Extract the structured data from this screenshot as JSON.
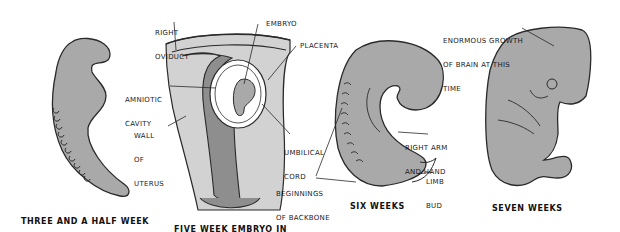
{
  "figure": {
    "colors": {
      "embryo_fill": "#a9a9a9",
      "uterus_fill": "#cfcfcf",
      "uterus_inner": "#8e8e8e",
      "outline": "#2a2a2a",
      "background": "#ffffff"
    },
    "panels": [
      {
        "id": "three-half-week",
        "caption_line1": "THREE AND A HALF WEEK",
        "caption_line2": "OLD EMBRYO"
      },
      {
        "id": "five-week",
        "caption_line1": "FIVE WEEK EMBRYO IN",
        "caption_line2": "POSITION IN UTERUS",
        "labels": {
          "right_oviduct_1": "RIGHT",
          "right_oviduct_2": "OVIDUCT",
          "embryo": "EMBRYO",
          "placenta": "PLACENTA",
          "amniotic_1": "AMNIOTIC",
          "amniotic_2": "CAVITY",
          "wall_1": "WALL",
          "wall_2": "OF",
          "wall_3": "UTERUS",
          "umbilical_1": "UMBILICAL",
          "umbilical_2": "CORD"
        }
      },
      {
        "id": "six-weeks",
        "caption": "SIX WEEKS",
        "labels": {
          "right_arm_1": "RIGHT ARM",
          "right_arm_2": "AND HAND",
          "limb_1": "LIMB",
          "limb_2": "BUD",
          "backbone_1": "BEGINNINGS",
          "backbone_2": "OF BACKBONE"
        }
      },
      {
        "id": "seven-weeks",
        "caption": "SEVEN WEEKS",
        "labels": {
          "growth_1": "ENORMOUS GROWTH",
          "growth_2": "OF BRAIN AT THIS",
          "growth_3": "TIME"
        }
      }
    ]
  }
}
